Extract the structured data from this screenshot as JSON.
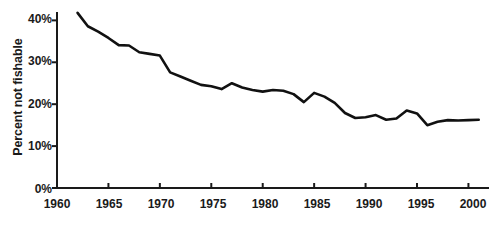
{
  "chart_data": {
    "type": "line",
    "title": "",
    "xlabel": "",
    "ylabel": "Percent not fishable",
    "xlim": [
      1960,
      2002
    ],
    "ylim": [
      0,
      42
    ],
    "grid": false,
    "legend": null,
    "y_tick_labels": [
      "0%",
      "10%",
      "20%",
      "30%",
      "40%"
    ],
    "y_tick_values": [
      0,
      10,
      20,
      30,
      40
    ],
    "x_tick_labels": [
      "1960",
      "1965",
      "1970",
      "1975",
      "1980",
      "1985",
      "1990",
      "1995",
      "2000"
    ],
    "x_tick_values": [
      1960,
      1965,
      1970,
      1975,
      1980,
      1985,
      1990,
      1995,
      2000
    ],
    "line_color": "#111111",
    "line_width": 2.6,
    "series": [
      {
        "name": "Percent not fishable",
        "x": [
          1962,
          1963,
          1964,
          1965,
          1966,
          1967,
          1968,
          1969,
          1970,
          1971,
          1972,
          1973,
          1974,
          1975,
          1976,
          1977,
          1978,
          1979,
          1980,
          1981,
          1982,
          1983,
          1984,
          1985,
          1986,
          1987,
          1988,
          1989,
          1990,
          1991,
          1992,
          1993,
          1994,
          1995,
          1996,
          1997,
          1998,
          1999,
          2000,
          2001
        ],
        "values": [
          41.8,
          38.6,
          37.3,
          35.8,
          34.1,
          34.0,
          32.4,
          32.0,
          31.6,
          27.6,
          26.6,
          25.6,
          24.6,
          24.3,
          23.6,
          25.0,
          24.0,
          23.4,
          23.0,
          23.4,
          23.2,
          22.4,
          20.5,
          22.7,
          21.8,
          20.3,
          17.9,
          16.7,
          16.9,
          17.4,
          16.3,
          16.6,
          18.5,
          17.8,
          15.0,
          15.8,
          16.2,
          16.1,
          16.2,
          16.3
        ]
      }
    ]
  }
}
